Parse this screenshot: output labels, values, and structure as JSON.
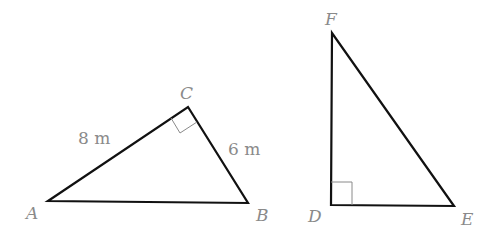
{
  "diagram": {
    "triangles": [
      {
        "name": "ABC",
        "vertices": {
          "A": {
            "label": "A",
            "x": 48,
            "y": 201
          },
          "B": {
            "label": "B",
            "x": 248,
            "y": 203
          },
          "C": {
            "label": "C",
            "x": 188,
            "y": 107
          }
        },
        "right_angle_at": "C",
        "side_labels": {
          "AC": "8 m",
          "CB": "6 m"
        }
      },
      {
        "name": "DEF",
        "vertices": {
          "D": {
            "label": "D",
            "x": 331,
            "y": 205
          },
          "E": {
            "label": "E",
            "x": 454,
            "y": 206
          },
          "F": {
            "label": "F",
            "x": 332,
            "y": 33
          }
        },
        "right_angle_at": "D",
        "side_labels": {}
      }
    ]
  },
  "colors": {
    "edge": "#111111",
    "label": "#8a8a8a",
    "right_angle_marker": "#8a8a8a"
  }
}
